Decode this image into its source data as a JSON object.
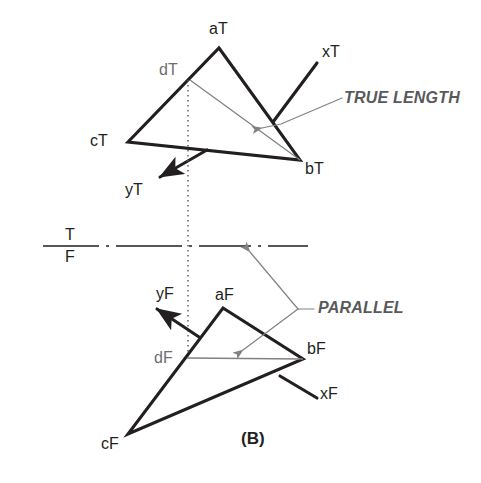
{
  "figure": {
    "caption": "(B)",
    "background_color": "#ffffff",
    "line_color_heavy": "#231f20",
    "line_color_light": "#808285",
    "label_color": "#231f20",
    "label_color_gray": "#6d6e71",
    "note_color": "#58595b"
  },
  "top_view": {
    "labels": {
      "a": "aT",
      "b": "bT",
      "c": "cT",
      "d": "dT",
      "x": "xT",
      "y": "yT"
    },
    "note": "TRUE LENGTH",
    "points": {
      "a": [
        219,
        48
      ],
      "b": [
        300,
        160
      ],
      "c": [
        128,
        142
      ],
      "d": [
        190,
        80
      ],
      "x_tip": [
        317,
        63
      ],
      "y_tip": [
        160,
        177
      ]
    }
  },
  "front_view": {
    "labels": {
      "a": "aF",
      "b": "bF",
      "c": "cF",
      "d": "dF",
      "x": "xF",
      "y": "yF"
    },
    "note": "PARALLEL",
    "points": {
      "a": [
        223,
        308
      ],
      "b": [
        303,
        359
      ],
      "c": [
        128,
        434
      ],
      "d": [
        187,
        358
      ],
      "x_tip": [
        317,
        398
      ],
      "y_tip": [
        157,
        309
      ]
    }
  },
  "fold_line": {
    "top_label": "T",
    "bottom_label": "F",
    "y": 246,
    "x_start": 43,
    "x_end": 336
  },
  "projection_line": {
    "x": 188,
    "y_start": 80,
    "y_end": 358,
    "style": "dotted"
  }
}
